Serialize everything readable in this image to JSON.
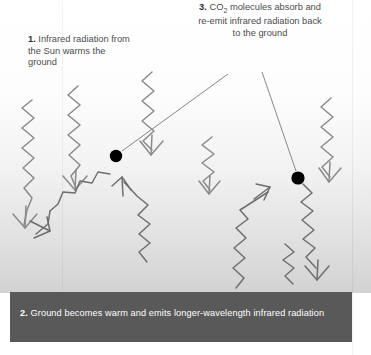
{
  "diagram": {
    "width": 371,
    "height": 355,
    "colors": {
      "sky_top": "#ffffff",
      "sky_bottom": "#d2d2d2",
      "ground_band": "#595959",
      "ground_text": "#ffffff",
      "wave_stroke": "#8a8a8a",
      "wave_stroke_dark": "#6e6e6e",
      "molecule": "#000000",
      "label_text": "#4c4c4c",
      "leader_line": "#7a7a7a"
    }
  },
  "labels": {
    "step1": {
      "number": "1.",
      "text": "Infrared radiation from the Sun warms the ground"
    },
    "step2": {
      "number": "2.",
      "text": "Ground becomes warm and emits longer-wavelength infrared radiation"
    },
    "step3": {
      "number": "3.",
      "text_before": "CO",
      "subscript": "2",
      "text_after": " molecules absorb and re-emit infrared radiation back to the ground"
    }
  },
  "elements": {
    "molecule_left": {
      "name": "co2-molecule",
      "x": 116,
      "y": 156,
      "r": 6.2
    },
    "molecule_right": {
      "name": "co2-molecule",
      "x": 298,
      "y": 178,
      "r": 6.6
    },
    "incoming_waves": 5,
    "outgoing_waves": 2,
    "reemitted_waves": 2
  }
}
